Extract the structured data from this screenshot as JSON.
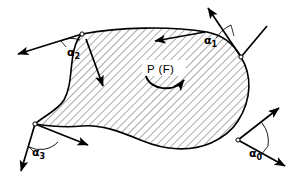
{
  "figure": {
    "background_color": "#ffffff",
    "stroke_color": "#000000",
    "hatch": {
      "pattern": "diagonal-lines",
      "angle_deg": 45,
      "spacing_px": 4,
      "line_color": "#6a6a6a"
    },
    "moment": {
      "label": "P (F)",
      "arc_direction": "counterclockwise-open-upward",
      "arrowhead_end": "right"
    },
    "angle_labels": [
      {
        "id": "alpha-1",
        "base": "α",
        "subscript": "1",
        "x": 208,
        "y": 40
      },
      {
        "id": "alpha-2",
        "base": "α",
        "subscript": "2",
        "x": 70,
        "y": 52
      },
      {
        "id": "alpha-3",
        "base": "α",
        "subscript": "3",
        "x": 33,
        "y": 152
      },
      {
        "id": "alpha-0",
        "base": "α",
        "subscript": "0",
        "x": 252,
        "y": 152
      }
    ],
    "vertices": [
      {
        "id": "vertex-top-left",
        "x": 82,
        "y": 34
      },
      {
        "id": "vertex-top-right",
        "x": 241,
        "y": 57
      },
      {
        "id": "vertex-bottom-left",
        "x": 35,
        "y": 124
      },
      {
        "id": "vertex-bottom-right",
        "x": 238,
        "y": 140
      }
    ],
    "vectors": [
      {
        "id": "vector-top-left-outward",
        "from": [
          82,
          34
        ],
        "to": [
          14,
          55
        ],
        "head": "arrow"
      },
      {
        "id": "vector-top-left-inward",
        "from": [
          86,
          38
        ],
        "to": [
          104,
          89
        ],
        "head": "arrow"
      },
      {
        "id": "vector-top-tangent",
        "from": [
          207,
          32
        ],
        "to": [
          152,
          42
        ],
        "head": "arrow"
      },
      {
        "id": "vector-top-right-outward",
        "from": [
          241,
          57
        ],
        "to": [
          206,
          5
        ],
        "head": "arrow"
      },
      {
        "id": "vector-top-right-edge",
        "from": [
          241,
          57
        ],
        "to": [
          266,
          27
        ],
        "head": "none"
      },
      {
        "id": "vector-bottom-left-down",
        "from": [
          35,
          124
        ],
        "to": [
          20,
          174
        ],
        "head": "arrow"
      },
      {
        "id": "vector-bottom-left-right",
        "from": [
          35,
          124
        ],
        "to": [
          91,
          146
        ],
        "head": "arrow"
      },
      {
        "id": "vector-bottom-right-up",
        "from": [
          238,
          140
        ],
        "to": [
          282,
          105
        ],
        "head": "arrow"
      },
      {
        "id": "vector-bottom-right-down",
        "from": [
          238,
          140
        ],
        "to": [
          288,
          168
        ],
        "head": "arrow"
      }
    ]
  }
}
